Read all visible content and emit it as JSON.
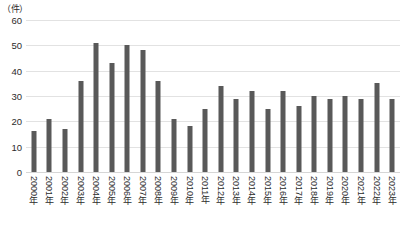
{
  "chart_data": {
    "type": "bar",
    "title": "",
    "subtitle": "",
    "xlabel": "",
    "ylabel": "（件）",
    "ylim": [
      0,
      60
    ],
    "yticks": [
      0,
      10,
      20,
      30,
      40,
      50,
      60
    ],
    "grid": true,
    "legend": false,
    "legend_position": "none",
    "bar_color": "#595959",
    "gridline_color": "#e2e2e2",
    "categories": [
      "2000年",
      "2001年",
      "2002年",
      "2003年",
      "2004年",
      "2005年",
      "2006年",
      "2007年",
      "2008年",
      "2009年",
      "2010年",
      "2011年",
      "2012年",
      "2013年",
      "2014年",
      "2015年",
      "2016年",
      "2017年",
      "2018年",
      "2019年",
      "2020年",
      "2021年",
      "2022年",
      "2023年"
    ],
    "values": [
      16,
      21,
      17,
      36,
      51,
      43,
      50,
      48,
      36,
      21,
      18,
      25,
      34,
      29,
      32,
      25,
      32,
      26,
      30,
      29,
      30,
      29,
      35,
      29
    ]
  }
}
